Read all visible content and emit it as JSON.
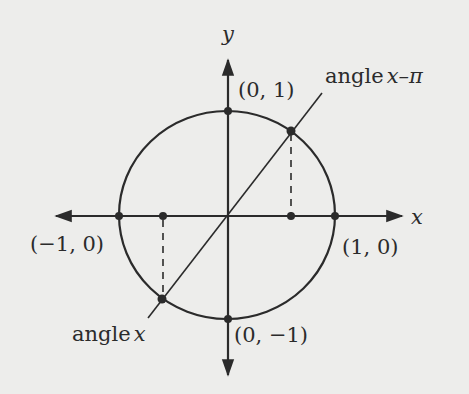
{
  "diagram": {
    "colors": {
      "background": "#ededeb",
      "ink": "#2b2b2b"
    },
    "axes": {
      "x_label": "x",
      "y_label": "y"
    },
    "points": {
      "top": "(0, 1)",
      "bottom": "(0, −1)",
      "left": "(−1, 0)",
      "right": "(1, 0)"
    },
    "angle_labels": {
      "angle_x_word": "angle",
      "angle_x_var": "x",
      "angle_x_minus_pi_word": "angle",
      "angle_x_minus_pi_var": "x–π"
    }
  }
}
